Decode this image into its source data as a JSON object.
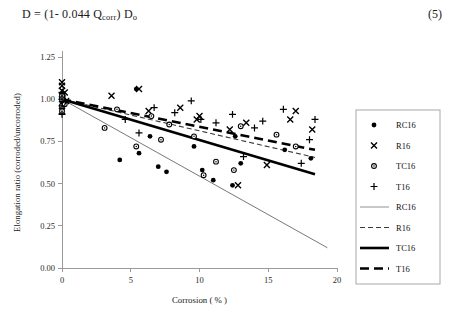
{
  "equation": {
    "text_before": "D  =  (1- 0.044 Q",
    "subscript": "corr",
    "text_after": ") D",
    "subscript2": "o",
    "number": "(5)"
  },
  "chart_data": {
    "type": "scatter",
    "title": "",
    "xlabel": "Corrosion  ( % )",
    "ylabel": "Elongation ratio (corroded/uncorroded)",
    "xlim": [
      0,
      20
    ],
    "ylim": [
      0,
      1.25
    ],
    "xticks": [
      0,
      5,
      10,
      15,
      20
    ],
    "xtick_labels": [
      "0",
      "5",
      "10",
      "15",
      "20"
    ],
    "yticks": [
      0.0,
      0.25,
      0.5,
      0.75,
      1.0,
      1.25
    ],
    "ytick_labels": [
      "0.00",
      "0.25",
      "0.50",
      "0.75",
      "1.00",
      "1.25"
    ],
    "grid": false,
    "legend_position": "right-outside",
    "series": [
      {
        "name": "RC16",
        "marker": "filled-circle",
        "color": "#000000",
        "points": [
          [
            0.0,
            1.03
          ],
          [
            0.0,
            1.01
          ],
          [
            0.0,
            0.99
          ],
          [
            0.0,
            0.97
          ],
          [
            0.0,
            0.95
          ],
          [
            0.1,
            1.02
          ],
          [
            0.15,
            0.98
          ],
          [
            4.2,
            0.64
          ],
          [
            5.4,
            1.06
          ],
          [
            5.6,
            0.68
          ],
          [
            6.4,
            0.78
          ],
          [
            7.0,
            0.6
          ],
          [
            7.6,
            0.57
          ],
          [
            9.6,
            0.72
          ],
          [
            10.2,
            0.58
          ],
          [
            11.0,
            0.52
          ],
          [
            12.4,
            0.49
          ],
          [
            12.6,
            0.78
          ],
          [
            13.0,
            0.62
          ],
          [
            16.2,
            0.7
          ],
          [
            18.1,
            0.65
          ]
        ]
      },
      {
        "name": "R16",
        "marker": "cross",
        "color": "#000000",
        "points": [
          [
            0.0,
            1.1
          ],
          [
            0.0,
            1.08
          ],
          [
            0.0,
            1.05
          ],
          [
            0.0,
            1.0
          ],
          [
            0.0,
            0.93
          ],
          [
            0.2,
            1.04
          ],
          [
            0.3,
            0.99
          ],
          [
            3.6,
            1.02
          ],
          [
            5.6,
            1.06
          ],
          [
            6.3,
            0.93
          ],
          [
            8.6,
            0.95
          ],
          [
            9.8,
            0.88
          ],
          [
            10.0,
            0.9
          ],
          [
            12.2,
            0.82
          ],
          [
            12.8,
            0.49
          ],
          [
            13.4,
            0.86
          ],
          [
            14.9,
            0.61
          ],
          [
            16.6,
            0.88
          ],
          [
            17.0,
            0.93
          ],
          [
            18.2,
            0.82
          ]
        ]
      },
      {
        "name": "TC16",
        "marker": "open-circle",
        "color": "#000000",
        "points": [
          [
            0.0,
            1.02
          ],
          [
            0.0,
            1.0
          ],
          [
            0.0,
            0.96
          ],
          [
            0.0,
            0.93
          ],
          [
            0.2,
            0.97
          ],
          [
            3.1,
            0.83
          ],
          [
            4.0,
            0.94
          ],
          [
            5.4,
            0.72
          ],
          [
            6.5,
            0.9
          ],
          [
            7.2,
            0.76
          ],
          [
            7.8,
            0.85
          ],
          [
            9.6,
            0.78
          ],
          [
            10.3,
            0.55
          ],
          [
            11.2,
            0.63
          ],
          [
            12.5,
            0.58
          ],
          [
            13.0,
            0.84
          ],
          [
            15.6,
            0.79
          ],
          [
            17.0,
            0.72
          ]
        ]
      },
      {
        "name": "T16",
        "marker": "plus",
        "color": "#000000",
        "points": [
          [
            0.0,
            1.04
          ],
          [
            0.0,
            1.0
          ],
          [
            0.0,
            0.96
          ],
          [
            0.0,
            0.91
          ],
          [
            0.25,
            0.99
          ],
          [
            4.6,
            0.88
          ],
          [
            5.6,
            0.8
          ],
          [
            6.7,
            0.95
          ],
          [
            8.2,
            0.92
          ],
          [
            9.4,
            0.99
          ],
          [
            10.1,
            0.88
          ],
          [
            11.2,
            0.86
          ],
          [
            12.4,
            0.91
          ],
          [
            13.2,
            0.66
          ],
          [
            14.0,
            0.83
          ],
          [
            14.6,
            0.87
          ],
          [
            16.1,
            0.94
          ],
          [
            17.4,
            0.62
          ],
          [
            18.0,
            0.76
          ],
          [
            18.4,
            0.88
          ]
        ]
      }
    ],
    "trendlines": [
      {
        "name": "RC16",
        "style": "thin-solid",
        "color": "#555555",
        "width": 0.8,
        "dash": "none",
        "x0": 0.0,
        "y0": 1.0,
        "x1": 19.3,
        "y1": 0.12
      },
      {
        "name": "R16",
        "style": "dashed",
        "color": "#3a3a3a",
        "width": 1.1,
        "dash": "5,3",
        "x0": 0.0,
        "y0": 1.0,
        "x1": 18.4,
        "y1": 0.655
      },
      {
        "name": "TC16",
        "style": "thick-solid",
        "color": "#000000",
        "width": 2.6,
        "dash": "none",
        "x0": 0.0,
        "y0": 1.0,
        "x1": 18.4,
        "y1": 0.555
      },
      {
        "name": "T16",
        "style": "thick-dashed",
        "color": "#000000",
        "width": 2.6,
        "dash": "9,5",
        "x0": 0.0,
        "y0": 1.0,
        "x1": 18.4,
        "y1": 0.7
      }
    ],
    "legend": [
      {
        "label": "RC16",
        "kind": "marker",
        "marker": "filled-circle"
      },
      {
        "label": "R16",
        "kind": "marker",
        "marker": "cross"
      },
      {
        "label": "TC16",
        "kind": "marker",
        "marker": "open-circle"
      },
      {
        "label": "T16",
        "kind": "marker",
        "marker": "plus"
      },
      {
        "label": "RC16",
        "kind": "line",
        "style": "thin-solid",
        "color": "#777777",
        "width": 0.8,
        "dash": "none"
      },
      {
        "label": "R16",
        "kind": "line",
        "style": "dashed",
        "color": "#3a3a3a",
        "width": 1.2,
        "dash": "5,3"
      },
      {
        "label": "TC16",
        "kind": "line",
        "style": "thick-solid",
        "color": "#000000",
        "width": 2.6,
        "dash": "none"
      },
      {
        "label": "T16",
        "kind": "line",
        "style": "thick-dashed",
        "color": "#000000",
        "width": 2.6,
        "dash": "9,5"
      }
    ]
  }
}
